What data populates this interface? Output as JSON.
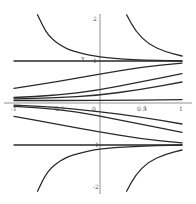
{
  "chart_data": {
    "type": "line",
    "title": "",
    "xlabel": "t",
    "ylabel": "y",
    "xlim": [
      -1,
      1
    ],
    "ylim": [
      -2,
      2
    ],
    "grid": false,
    "legend": "none",
    "x_ticks": [
      {
        "value": -1,
        "label": "-1"
      },
      {
        "value": -0.5,
        "label": "-0.5"
      },
      {
        "value": 0,
        "label": "0"
      },
      {
        "value": 0.5,
        "label": "0.5"
      },
      {
        "value": 1,
        "label": "1"
      }
    ],
    "y_ticks": [
      {
        "value": 2,
        "label": "2"
      },
      {
        "value": 1,
        "label": "1"
      },
      {
        "value": -1,
        "label": "-1"
      },
      {
        "value": -2,
        "label": "-2"
      }
    ],
    "series": [
      {
        "name": "equilibrium y=1",
        "points": [
          [
            -1,
            1
          ],
          [
            1,
            1
          ]
        ]
      },
      {
        "name": "equilibrium y=-1",
        "points": [
          [
            -1,
            -1
          ],
          [
            1,
            -1
          ]
        ]
      },
      {
        "name": "upper-left blowup",
        "points": [
          [
            -0.72,
            2.1
          ],
          [
            -0.6,
            1.6
          ],
          [
            -0.4,
            1.3
          ],
          [
            -0.2,
            1.18
          ],
          [
            0,
            1.1
          ],
          [
            0.4,
            1.03
          ],
          [
            1,
            1.0
          ]
        ]
      },
      {
        "name": "upper-right blowup",
        "points": [
          [
            0.34,
            2.1
          ],
          [
            0.45,
            1.7
          ],
          [
            0.6,
            1.4
          ],
          [
            0.8,
            1.22
          ],
          [
            1,
            1.12
          ]
        ]
      },
      {
        "name": "solution a",
        "points": [
          [
            -1,
            0.35
          ],
          [
            -0.5,
            0.5
          ],
          [
            0,
            0.68
          ],
          [
            0.5,
            0.85
          ],
          [
            1,
            0.95
          ]
        ]
      },
      {
        "name": "solution b",
        "points": [
          [
            -1,
            0.13
          ],
          [
            -0.5,
            0.18
          ],
          [
            0,
            0.3
          ],
          [
            0.5,
            0.5
          ],
          [
            1,
            0.7
          ]
        ]
      },
      {
        "name": "solution c",
        "points": [
          [
            -1,
            0.1
          ],
          [
            -0.5,
            0.12
          ],
          [
            0,
            0.18
          ],
          [
            0.5,
            0.32
          ],
          [
            1,
            0.5
          ]
        ]
      },
      {
        "name": "solution d",
        "points": [
          [
            -1,
            0.06
          ],
          [
            0,
            0.06
          ],
          [
            1,
            0.08
          ]
        ]
      },
      {
        "name": "solution e",
        "points": [
          [
            -1,
            -0.05
          ],
          [
            -0.5,
            -0.1
          ],
          [
            0,
            -0.2
          ],
          [
            0.5,
            -0.33
          ],
          [
            1,
            -0.5
          ]
        ]
      },
      {
        "name": "solution f",
        "points": [
          [
            -1,
            -0.08
          ],
          [
            -0.5,
            -0.14
          ],
          [
            0,
            -0.3
          ],
          [
            0.5,
            -0.5
          ],
          [
            1,
            -0.7
          ]
        ]
      },
      {
        "name": "solution g",
        "points": [
          [
            -1,
            -0.32
          ],
          [
            -0.5,
            -0.5
          ],
          [
            0,
            -0.68
          ],
          [
            0.5,
            -0.85
          ],
          [
            1,
            -0.95
          ]
        ]
      },
      {
        "name": "lower-left blowup",
        "points": [
          [
            -0.72,
            -2.1
          ],
          [
            -0.6,
            -1.6
          ],
          [
            -0.4,
            -1.3
          ],
          [
            -0.2,
            -1.18
          ],
          [
            0,
            -1.1
          ],
          [
            0.4,
            -1.03
          ],
          [
            1,
            -1.0
          ]
        ]
      },
      {
        "name": "lower-right blowup",
        "points": [
          [
            0.34,
            -2.1
          ],
          [
            0.45,
            -1.7
          ],
          [
            0.6,
            -1.4
          ],
          [
            0.8,
            -1.22
          ],
          [
            1,
            -1.12
          ]
        ]
      }
    ],
    "annotations": [
      {
        "text": "y",
        "x": -0.2,
        "y": 1.0
      },
      {
        "text": "t",
        "x": 0.55,
        "y": -0.18
      }
    ]
  }
}
